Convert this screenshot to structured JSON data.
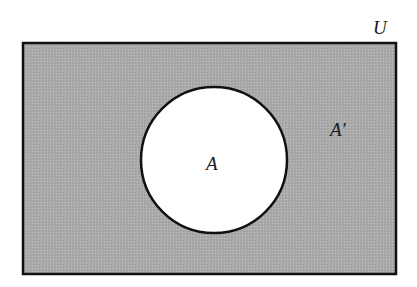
{
  "diagram": {
    "type": "venn",
    "universe": {
      "label": "U",
      "fill": "#a9a9a9",
      "stroke": "#111111",
      "x": 23,
      "y": 43,
      "width": 373,
      "height": 231
    },
    "set": {
      "label": "A",
      "fill": "#ffffff",
      "stroke": "#111111",
      "cx": 214,
      "cy": 160,
      "r": 73
    },
    "complement": {
      "label": "A′"
    }
  }
}
